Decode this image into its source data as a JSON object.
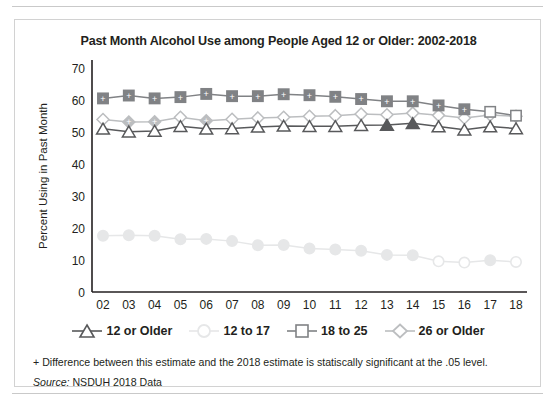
{
  "figure": {
    "title": "Past Month Alcohol Use among People Aged 12 or Older: 2002-2018",
    "ylabel": "Percent Using in Past Month",
    "footnote": "+ Difference between this estimate and the 2018 estimate is statiscally significant at the .05 level.",
    "source_prefix": "Source:",
    "source_text": "NSDUH 2018 Data"
  },
  "legend": {
    "items": [
      {
        "label": "12 or Older",
        "marker": "triangle",
        "color": "#58595b"
      },
      {
        "label": "12 to 17",
        "marker": "circle",
        "color": "#e6e7e8"
      },
      {
        "label": "18 to 25",
        "marker": "square",
        "color": "#808285"
      },
      {
        "label": "26 or Older",
        "marker": "diamond",
        "color": "#bcbec0"
      }
    ]
  },
  "chart_data": {
    "type": "line",
    "title": "Past Month Alcohol Use among People Aged 12 or Older: 2002-2018",
    "xlabel": "",
    "ylabel": "Percent Using in Past Month",
    "ylim": [
      0,
      70
    ],
    "yticks": [
      0,
      10,
      20,
      30,
      40,
      50,
      60,
      70
    ],
    "grid": false,
    "legend_position": "bottom",
    "categories": [
      "02",
      "03",
      "04",
      "05",
      "06",
      "07",
      "08",
      "09",
      "10",
      "11",
      "12",
      "13",
      "14",
      "15",
      "16",
      "17",
      "18"
    ],
    "series": [
      {
        "name": "12 or Older",
        "color": "#58595b",
        "marker": "triangle",
        "values": [
          51.0,
          50.1,
          50.3,
          51.8,
          51.0,
          51.1,
          51.6,
          51.9,
          51.8,
          51.8,
          52.1,
          52.2,
          52.7,
          51.7,
          50.7,
          51.7,
          51.1
        ],
        "significant_flags": [
          false,
          false,
          false,
          false,
          false,
          false,
          false,
          false,
          false,
          false,
          false,
          true,
          true,
          false,
          false,
          false,
          false
        ]
      },
      {
        "name": "12 to 17",
        "color": "#e6e7e8",
        "marker": "circle",
        "values": [
          17.6,
          17.7,
          17.6,
          16.5,
          16.6,
          15.9,
          14.6,
          14.7,
          13.6,
          13.3,
          12.9,
          11.6,
          11.5,
          9.6,
          9.2,
          9.9,
          9.4
        ],
        "significant_flags": [
          true,
          true,
          true,
          true,
          true,
          true,
          true,
          true,
          true,
          true,
          true,
          true,
          true,
          false,
          false,
          true,
          false
        ]
      },
      {
        "name": "18 to 25",
        "color": "#808285",
        "marker": "square",
        "values": [
          60.5,
          61.4,
          60.5,
          60.9,
          61.9,
          61.2,
          61.2,
          61.8,
          61.5,
          61.0,
          60.3,
          59.6,
          59.6,
          58.3,
          57.1,
          56.3,
          55.1
        ],
        "significant_flags": [
          true,
          true,
          true,
          true,
          true,
          true,
          true,
          true,
          true,
          true,
          true,
          true,
          true,
          true,
          true,
          false,
          false
        ]
      },
      {
        "name": "26 or Older",
        "color": "#bcbec0",
        "marker": "diamond",
        "values": [
          53.9,
          53.1,
          53.2,
          54.6,
          53.5,
          54.0,
          54.4,
          54.6,
          54.9,
          55.1,
          55.6,
          55.4,
          55.9,
          55.2,
          54.4,
          55.3,
          54.9
        ],
        "significant_flags": [
          false,
          true,
          true,
          false,
          true,
          false,
          false,
          false,
          false,
          false,
          false,
          false,
          false,
          false,
          false,
          false,
          false
        ]
      }
    ]
  }
}
